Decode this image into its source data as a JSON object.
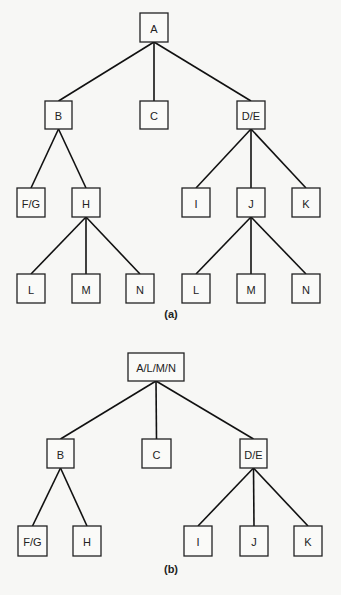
{
  "figure": {
    "trees": [
      {
        "id": "a",
        "caption": "(a)",
        "caption_pos": [
          171,
          318
        ],
        "nodes": [
          {
            "id": "A",
            "label": "A",
            "x": 140,
            "y": 13,
            "w": 28,
            "h": 29
          },
          {
            "id": "B",
            "label": "B",
            "x": 45,
            "y": 101,
            "w": 27,
            "h": 28
          },
          {
            "id": "C",
            "label": "C",
            "x": 140,
            "y": 101,
            "w": 28,
            "h": 28
          },
          {
            "id": "DE",
            "label": "D/E",
            "x": 237,
            "y": 101,
            "w": 28,
            "h": 28
          },
          {
            "id": "FG",
            "label": "F/G",
            "x": 17,
            "y": 188,
            "w": 28,
            "h": 29
          },
          {
            "id": "H",
            "label": "H",
            "x": 72,
            "y": 188,
            "w": 28,
            "h": 29
          },
          {
            "id": "I",
            "label": "I",
            "x": 182,
            "y": 188,
            "w": 28,
            "h": 29
          },
          {
            "id": "J",
            "label": "J",
            "x": 237,
            "y": 188,
            "w": 28,
            "h": 29
          },
          {
            "id": "K",
            "label": "K",
            "x": 292,
            "y": 188,
            "w": 28,
            "h": 29
          },
          {
            "id": "L1",
            "label": "L",
            "x": 17,
            "y": 274,
            "w": 28,
            "h": 29
          },
          {
            "id": "M1",
            "label": "M",
            "x": 72,
            "y": 274,
            "w": 28,
            "h": 29
          },
          {
            "id": "N1",
            "label": "N",
            "x": 126,
            "y": 274,
            "w": 28,
            "h": 29
          },
          {
            "id": "L2",
            "label": "L",
            "x": 182,
            "y": 274,
            "w": 28,
            "h": 29
          },
          {
            "id": "M2",
            "label": "M",
            "x": 237,
            "y": 274,
            "w": 28,
            "h": 29
          },
          {
            "id": "N2",
            "label": "N",
            "x": 292,
            "y": 274,
            "w": 28,
            "h": 29
          }
        ],
        "edges": [
          [
            "A",
            "B"
          ],
          [
            "A",
            "C"
          ],
          [
            "A",
            "DE"
          ],
          [
            "B",
            "FG"
          ],
          [
            "B",
            "H"
          ],
          [
            "DE",
            "I"
          ],
          [
            "DE",
            "J"
          ],
          [
            "DE",
            "K"
          ],
          [
            "H",
            "L1"
          ],
          [
            "H",
            "M1"
          ],
          [
            "H",
            "N1"
          ],
          [
            "J",
            "L2"
          ],
          [
            "J",
            "M2"
          ],
          [
            "J",
            "N2"
          ]
        ]
      },
      {
        "id": "b",
        "caption": "(b)",
        "caption_pos": [
          171,
          573
        ],
        "nodes": [
          {
            "id": "ALMN",
            "label": "A/L/M/N",
            "x": 128,
            "y": 353,
            "w": 56,
            "h": 28
          },
          {
            "id": "B",
            "label": "B",
            "x": 47,
            "y": 439,
            "w": 27,
            "h": 29
          },
          {
            "id": "C",
            "label": "C",
            "x": 142,
            "y": 439,
            "w": 29,
            "h": 29
          },
          {
            "id": "DE",
            "label": "D/E",
            "x": 240,
            "y": 439,
            "w": 27,
            "h": 29
          },
          {
            "id": "FG",
            "label": "F/G",
            "x": 18,
            "y": 526,
            "w": 29,
            "h": 30
          },
          {
            "id": "H",
            "label": "H",
            "x": 73,
            "y": 526,
            "w": 28,
            "h": 30
          },
          {
            "id": "I",
            "label": "I",
            "x": 184,
            "y": 526,
            "w": 28,
            "h": 30
          },
          {
            "id": "J",
            "label": "J",
            "x": 240,
            "y": 526,
            "w": 28,
            "h": 30
          },
          {
            "id": "K",
            "label": "K",
            "x": 294,
            "y": 526,
            "w": 28,
            "h": 30
          }
        ],
        "edges": [
          [
            "ALMN",
            "B"
          ],
          [
            "ALMN",
            "C"
          ],
          [
            "ALMN",
            "DE"
          ],
          [
            "B",
            "FG"
          ],
          [
            "B",
            "H"
          ],
          [
            "DE",
            "I"
          ],
          [
            "DE",
            "J"
          ],
          [
            "DE",
            "K"
          ]
        ]
      }
    ]
  }
}
